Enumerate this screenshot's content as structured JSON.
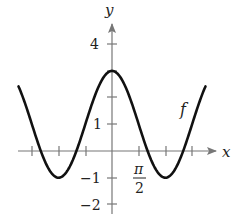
{
  "chart_data": {
    "type": "line",
    "title": "",
    "xlabel": "x",
    "ylabel": "y",
    "function_label": "f",
    "function": "f(x) = 1 + 2cos(x)",
    "x_range_radians": [
      -5.5,
      5.5
    ],
    "ylim": [
      -2,
      4.5
    ],
    "x_ticks": [
      "-3π/2",
      "-π",
      "-π/2",
      "0",
      "π/2",
      "π",
      "3π/2"
    ],
    "x_tick_labels_shown": [
      {
        "value": "π/2",
        "numerator": "π",
        "denominator": "2"
      }
    ],
    "y_ticks": [
      -2,
      -1,
      1,
      2,
      3,
      4
    ],
    "y_tick_labels_shown": [
      "4",
      "1",
      "−1",
      "−2"
    ],
    "key_points": [
      {
        "x": "0",
        "y": 3,
        "note": "maximum"
      },
      {
        "x": "-π",
        "y": -1,
        "note": "minimum"
      },
      {
        "x": "π",
        "y": -1,
        "note": "minimum"
      }
    ],
    "grid": false,
    "legend": "none",
    "colors": {
      "curve": "#111111",
      "axes": "#777777"
    }
  },
  "labels": {
    "x_axis": "x",
    "y_axis": "y",
    "curve": "f",
    "y4": "4",
    "y1": "1",
    "ym1": "−1",
    "ym2": "−2",
    "pi": "π",
    "two": "2"
  }
}
